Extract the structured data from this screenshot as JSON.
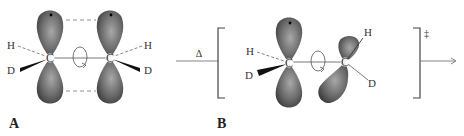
{
  "figure": {
    "panel_a": {
      "label": "A",
      "atoms": {
        "left_carbon": "C",
        "right_carbon": "C",
        "left_h": "H",
        "left_d": "D",
        "right_h": "H",
        "right_d": "D"
      }
    },
    "arrow_1": {
      "label": "Δ"
    },
    "panel_b": {
      "label": "B",
      "atoms": {
        "left_carbon": "C",
        "right_carbon": "C",
        "left_h": "H",
        "left_d": "D",
        "right_h": "H",
        "right_d": "D"
      },
      "transition_state_symbol": "‡"
    },
    "colors": {
      "orbital_dark": "#3a3a3a",
      "orbital_light": "#9a9a9a",
      "line": "#555555"
    }
  }
}
